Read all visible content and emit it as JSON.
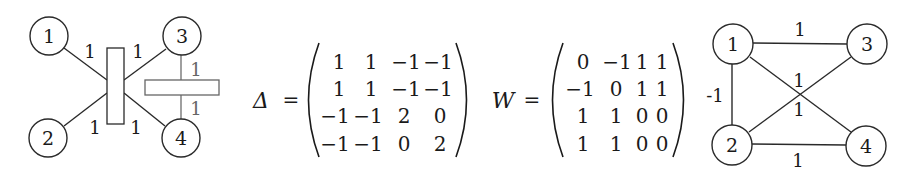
{
  "hypergraph": {
    "nodes": [
      {
        "id": "1",
        "label": "1",
        "x": 49,
        "y": 36
      },
      {
        "id": "2",
        "label": "2",
        "x": 48,
        "y": 138
      },
      {
        "id": "3",
        "label": "3",
        "x": 182,
        "y": 36
      },
      {
        "id": "4",
        "label": "4",
        "x": 181,
        "y": 138
      }
    ],
    "hyperedges": [
      {
        "id": "e1",
        "members": [
          "1",
          "2",
          "3",
          "4"
        ],
        "orientation": "vertical",
        "weights": [
          "1",
          "1",
          "1",
          "1"
        ]
      },
      {
        "id": "e2",
        "members": [
          "3",
          "4"
        ],
        "orientation": "horizontal",
        "weights": [
          "1",
          "1"
        ]
      }
    ],
    "edge_labels": {
      "e1_n1": "1",
      "e1_n3": "1",
      "e1_n2": "1",
      "e1_n4": "1",
      "e2_n3": "1",
      "e2_n4": "1"
    }
  },
  "delta_matrix": {
    "symbol": "Δ",
    "equals": "=",
    "rows": [
      [
        "1",
        "1",
        "−1",
        "−1"
      ],
      [
        "1",
        "1",
        "−1",
        "−1"
      ],
      [
        "−1",
        "−1",
        "2",
        "0"
      ],
      [
        "−1",
        "−1",
        "0",
        "2"
      ]
    ]
  },
  "w_matrix": {
    "symbol": "W",
    "equals": "=",
    "rows": [
      [
        "0",
        "−1",
        "1",
        "1"
      ],
      [
        "−1",
        "0",
        "1",
        "1"
      ],
      [
        "1",
        "1",
        "0",
        "0"
      ],
      [
        "1",
        "1",
        "0",
        "0"
      ]
    ]
  },
  "graph": {
    "nodes": [
      {
        "id": "1",
        "label": "1"
      },
      {
        "id": "2",
        "label": "2"
      },
      {
        "id": "3",
        "label": "3"
      },
      {
        "id": "4",
        "label": "4"
      }
    ],
    "edges": [
      {
        "from": "1",
        "to": "3",
        "weight": "1"
      },
      {
        "from": "1",
        "to": "2",
        "weight": "-1"
      },
      {
        "from": "1",
        "to": "4",
        "weight": "1"
      },
      {
        "from": "2",
        "to": "3",
        "weight": "1"
      },
      {
        "from": "2",
        "to": "4",
        "weight": "1"
      }
    ]
  }
}
